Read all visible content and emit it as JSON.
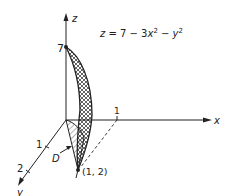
{
  "figure": {
    "equation_label": "z = 7 − 3x² − y²",
    "equation": {
      "z": "z",
      "eq": " = 7 − 3",
      "x": "x",
      "sq1": "2",
      "minus": " − ",
      "y": "y",
      "sq2": "2"
    },
    "axes": {
      "x": "x",
      "y": "y",
      "z": "z"
    },
    "ticks": {
      "z_top": "7",
      "x_one": "1",
      "y_one": "1",
      "y_two": "2"
    },
    "region_label": "D",
    "point_label": "(1, 2)",
    "colors": {
      "ink": "#222222",
      "background": "#ffffff"
    }
  }
}
